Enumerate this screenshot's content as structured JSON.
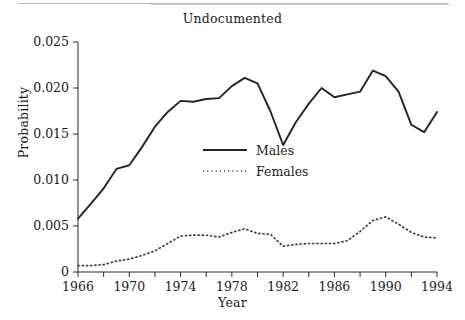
{
  "chart_data": {
    "type": "line",
    "title": "Undocumented",
    "xlabel": "Year",
    "ylabel": "Probability",
    "xlim": [
      1966,
      1994
    ],
    "ylim": [
      0,
      0.025
    ],
    "grid": false,
    "legend_position": "center-left-inside",
    "x_major_ticks": [
      1966,
      1970,
      1974,
      1978,
      1982,
      1986,
      1990,
      1994
    ],
    "x_minor_ticks": [
      1968,
      1972,
      1976,
      1980,
      1984,
      1988,
      1992
    ],
    "x_tick_labels": [
      "1966",
      "1970",
      "1974",
      "1978",
      "1982",
      "1986",
      "1990",
      "1994"
    ],
    "y_ticks": [
      0,
      0.005,
      0.01,
      0.015,
      0.02,
      0.025
    ],
    "y_tick_labels": [
      "0",
      "0.005",
      "0.010",
      "0.015",
      "0.020",
      "0.025"
    ],
    "x": [
      1966,
      1967,
      1968,
      1969,
      1970,
      1971,
      1972,
      1973,
      1974,
      1975,
      1976,
      1977,
      1978,
      1979,
      1980,
      1981,
      1982,
      1983,
      1984,
      1985,
      1986,
      1987,
      1988,
      1989,
      1990,
      1991,
      1992,
      1993,
      1994
    ],
    "series": [
      {
        "name": "Males",
        "style": "solid",
        "color": "#232323",
        "values": [
          0.0058,
          0.0074,
          0.0091,
          0.0112,
          0.0116,
          0.0136,
          0.0158,
          0.0174,
          0.0186,
          0.0185,
          0.0188,
          0.0189,
          0.0202,
          0.0211,
          0.0205,
          0.0175,
          0.0138,
          0.0163,
          0.0183,
          0.02,
          0.019,
          0.0193,
          0.0196,
          0.0219,
          0.0213,
          0.0196,
          0.016,
          0.0152,
          0.0174
        ]
      },
      {
        "name": "Females",
        "style": "dotted",
        "color": "#3a3a3a",
        "values": [
          0.0007,
          0.0007,
          0.0008,
          0.0012,
          0.0014,
          0.0018,
          0.0023,
          0.0031,
          0.0039,
          0.004,
          0.004,
          0.0038,
          0.0043,
          0.0047,
          0.0042,
          0.0041,
          0.0028,
          0.003,
          0.0031,
          0.0031,
          0.0031,
          0.0034,
          0.0044,
          0.0056,
          0.006,
          0.0052,
          0.0043,
          0.0038,
          0.0037
        ]
      }
    ],
    "legend_entries": [
      {
        "label": "Males",
        "style": "solid"
      },
      {
        "label": "Females",
        "style": "dotted"
      }
    ]
  }
}
